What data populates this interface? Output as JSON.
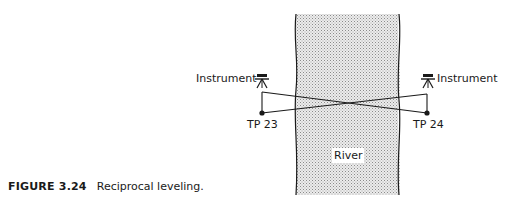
{
  "figure": {
    "number": "FIGURE 3.24",
    "caption": "Reciprocal leveling."
  },
  "diagram": {
    "river_label": "River",
    "left_instrument_label": "Instrument",
    "right_instrument_label": "Instrument",
    "left_turning_point": "TP 23",
    "right_turning_point": "TP 24",
    "icons": {
      "instrument": "level-tripod-icon",
      "turning_point": "dot-marker"
    },
    "colors": {
      "line": "#1a1a1a",
      "river_fill": "#d9d9d9",
      "background": "#ffffff"
    }
  }
}
